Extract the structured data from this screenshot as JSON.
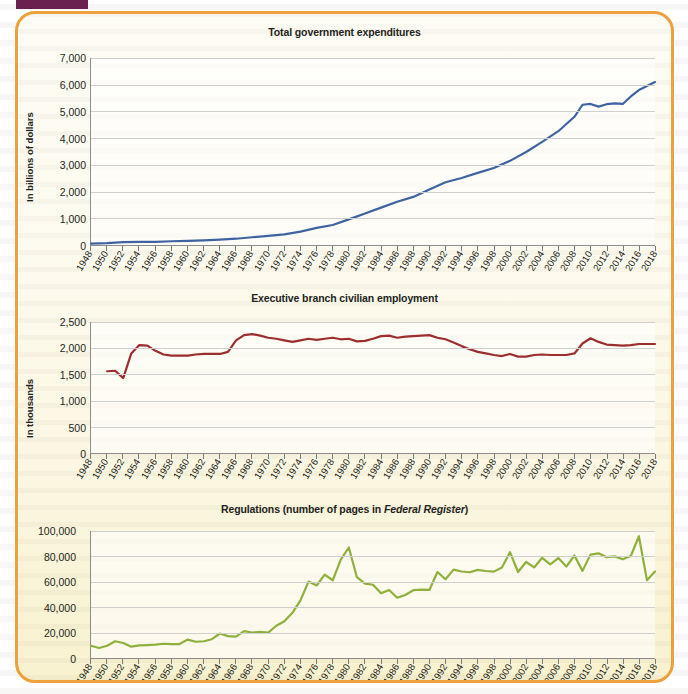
{
  "figure": {
    "frame_color": "#eda13c",
    "tab_color": "#6b2150",
    "background": "#fdfbef"
  },
  "axis": {
    "x_start": 1948,
    "x_end": 2018,
    "x_tick_step": 2,
    "x_tick_labels": [
      "1948",
      "1950",
      "1952",
      "1954",
      "1956",
      "1958",
      "1960",
      "1962",
      "1964",
      "1966",
      "1968",
      "1970",
      "1972",
      "1974",
      "1976",
      "1978",
      "1980",
      "1982",
      "1984",
      "1986",
      "1988",
      "1990",
      "1992",
      "1994",
      "1996",
      "1998",
      "2000",
      "2002",
      "2004",
      "2006",
      "2008",
      "2010",
      "2012",
      "2014",
      "2016",
      "2018"
    ]
  },
  "charts": [
    {
      "id": "total-government-expenditures",
      "title": "Total government expenditures",
      "title_italic": "",
      "ylabel": "In billions of dollars",
      "line_color": "#3f63a0",
      "ytick_labels": [
        "7,000",
        "6,000",
        "5,000",
        "4,000",
        "3,000",
        "2,000",
        "1,000",
        "0"
      ]
    },
    {
      "id": "executive-branch-civilian-employment",
      "title": "Executive branch civilian employment",
      "title_italic": "",
      "ylabel": "In thousands",
      "line_color": "#9c2e2e",
      "ytick_labels": [
        "2,500",
        "2,000",
        "1,500",
        "1,000",
        "500",
        "0"
      ]
    },
    {
      "id": "regulations-federal-register-pages",
      "title": "Regulations (number of pages in ",
      "title_italic": "Federal Register",
      "title_tail": ")",
      "ylabel": "",
      "line_color": "#8fb03c",
      "ytick_labels": [
        "100,000",
        "80,000",
        "60,000",
        "40,000",
        "20,000",
        "0"
      ]
    }
  ],
  "chart_data": [
    {
      "type": "line",
      "title": "Total government expenditures",
      "xlabel": "",
      "ylabel": "In billions of dollars",
      "xlim": [
        1948,
        2018
      ],
      "ylim": [
        0,
        7000
      ],
      "ytick_step": 1000,
      "grid": true,
      "legend": "none",
      "color": "#3f63a0",
      "x": [
        1948,
        1950,
        1952,
        1954,
        1956,
        1958,
        1960,
        1962,
        1964,
        1966,
        1968,
        1970,
        1972,
        1974,
        1976,
        1978,
        1980,
        1982,
        1984,
        1986,
        1988,
        1990,
        1992,
        1994,
        1996,
        1998,
        2000,
        2002,
        2004,
        2006,
        2008,
        2009,
        2010,
        2011,
        2012,
        2013,
        2014,
        2015,
        2016,
        2017,
        2018
      ],
      "values": [
        55,
        70,
        110,
        115,
        120,
        140,
        155,
        175,
        200,
        235,
        290,
        340,
        400,
        500,
        640,
        750,
        960,
        1180,
        1400,
        1620,
        1800,
        2080,
        2350,
        2510,
        2700,
        2880,
        3150,
        3480,
        3860,
        4260,
        4800,
        5250,
        5280,
        5180,
        5270,
        5300,
        5280,
        5560,
        5800,
        5950,
        6100
      ]
    },
    {
      "type": "line",
      "title": "Executive branch civilian employment",
      "xlabel": "",
      "ylabel": "In thousands",
      "xlim": [
        1948,
        2018
      ],
      "ylim": [
        0,
        2500
      ],
      "ytick_step": 500,
      "grid": true,
      "legend": "none",
      "color": "#9c2e2e",
      "x": [
        1950,
        1951,
        1952,
        1953,
        1954,
        1955,
        1956,
        1957,
        1958,
        1959,
        1960,
        1961,
        1962,
        1963,
        1964,
        1965,
        1966,
        1967,
        1968,
        1969,
        1970,
        1971,
        1972,
        1973,
        1974,
        1975,
        1976,
        1977,
        1978,
        1979,
        1980,
        1981,
        1982,
        1983,
        1984,
        1985,
        1986,
        1987,
        1988,
        1989,
        1990,
        1991,
        1992,
        1993,
        1994,
        1995,
        1996,
        1997,
        1998,
        1999,
        2000,
        2001,
        2002,
        2003,
        2004,
        2005,
        2006,
        2007,
        2008,
        2009,
        2010,
        2011,
        2012,
        2013,
        2014,
        2015,
        2016,
        2017,
        2018
      ],
      "values": [
        1560,
        1570,
        1430,
        1900,
        2060,
        2050,
        1950,
        1880,
        1860,
        1860,
        1860,
        1880,
        1890,
        1890,
        1890,
        1930,
        2150,
        2250,
        2270,
        2240,
        2200,
        2180,
        2150,
        2120,
        2150,
        2180,
        2160,
        2180,
        2200,
        2170,
        2180,
        2130,
        2140,
        2180,
        2230,
        2240,
        2200,
        2220,
        2230,
        2240,
        2250,
        2200,
        2170,
        2110,
        2040,
        1980,
        1930,
        1900,
        1870,
        1850,
        1890,
        1840,
        1840,
        1870,
        1880,
        1870,
        1870,
        1870,
        1900,
        2090,
        2190,
        2120,
        2070,
        2060,
        2050,
        2060,
        2080,
        2080,
        2080
      ]
    },
    {
      "type": "line",
      "title": "Regulations (number of pages in Federal Register)",
      "xlabel": "",
      "ylabel": "",
      "xlim": [
        1948,
        2018
      ],
      "ylim": [
        0,
        100000
      ],
      "ytick_step": 20000,
      "grid": true,
      "legend": "none",
      "color": "#8fb03c",
      "x": [
        1948,
        1949,
        1950,
        1951,
        1952,
        1953,
        1954,
        1955,
        1956,
        1957,
        1958,
        1959,
        1960,
        1961,
        1962,
        1963,
        1964,
        1965,
        1966,
        1967,
        1968,
        1969,
        1970,
        1971,
        1972,
        1973,
        1974,
        1975,
        1976,
        1977,
        1978,
        1979,
        1980,
        1981,
        1982,
        1983,
        1984,
        1985,
        1986,
        1987,
        1988,
        1989,
        1990,
        1991,
        1992,
        1993,
        1994,
        1995,
        1996,
        1997,
        1998,
        1999,
        2000,
        2001,
        2002,
        2003,
        2004,
        2005,
        2006,
        2007,
        2008,
        2009,
        2010,
        2011,
        2012,
        2013,
        2014,
        2015,
        2016,
        2017,
        2018
      ],
      "values": [
        9600,
        7900,
        9600,
        13200,
        11800,
        8900,
        9900,
        10200,
        10500,
        11200,
        10900,
        11000,
        14500,
        12800,
        13200,
        14800,
        19300,
        17200,
        16800,
        21100,
        20100,
        20500,
        20000,
        25400,
        28900,
        35600,
        45400,
        60200,
        57100,
        65600,
        61200,
        77500,
        87000,
        63600,
        58500,
        57700,
        50900,
        53500,
        47400,
        49600,
        53400,
        53800,
        53600,
        67700,
        62000,
        69600,
        68100,
        67500,
        69400,
        68500,
        68000,
        71200,
        83300,
        67700,
        75600,
        71300,
        78900,
        73800,
        78700,
        72000,
        80700,
        68600,
        81400,
        82400,
        79400,
        80000,
        77700,
        80300,
        95900,
        61300,
        68100
      ]
    }
  ]
}
